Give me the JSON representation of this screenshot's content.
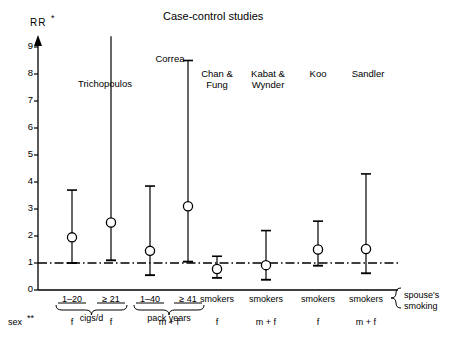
{
  "chart_data": {
    "type": "scatter",
    "title": "Case-control studies",
    "ylabel": "RR",
    "ylabel_superscript": "*",
    "xlabel": "",
    "ylim": [
      0,
      9.4
    ],
    "yticks": [
      0,
      1,
      2,
      3,
      4,
      5,
      6,
      7,
      8,
      9
    ],
    "ytick_labels": [
      "0",
      "1",
      "2",
      "3",
      "4",
      "5",
      "6",
      "7",
      "8",
      "9"
    ],
    "grid": false,
    "legend": null,
    "reference_line": {
      "value": 1,
      "style": "dash-dot"
    },
    "axis_color": "#000000",
    "marker": "open-circle",
    "series": [
      {
        "name": "Relative risk with 95% confidence interval",
        "points": [
          {
            "study": "Trichopoulos",
            "exposure": "1–20",
            "group": "cigs/d",
            "sex": "f",
            "value": 1.95,
            "low": 1.0,
            "high": 3.7,
            "clipped_high": false
          },
          {
            "study": "Trichopoulos",
            "exposure": "≥ 21",
            "group": "cigs/d",
            "sex": "f",
            "value": 2.5,
            "low": 1.1,
            "high": 9.4,
            "clipped_high": true
          },
          {
            "study": "Correa",
            "exposure": "1–40",
            "group": "pack years",
            "sex": "m + f",
            "value": 1.45,
            "low": 0.55,
            "high": 3.85,
            "clipped_high": false
          },
          {
            "study": "Correa",
            "exposure": "≥ 41",
            "group": "pack years",
            "sex": "m + f",
            "value": 3.1,
            "low": 1.05,
            "high": 8.5,
            "clipped_high": false
          },
          {
            "study": "Chan & Fung",
            "exposure": "smokers",
            "group": "",
            "sex": "f",
            "value": 0.78,
            "low": 0.45,
            "high": 1.25,
            "clipped_high": false
          },
          {
            "study": "Kabat & Wynder",
            "exposure": "smokers",
            "group": "",
            "sex": "m + f",
            "value": 0.92,
            "low": 0.38,
            "high": 2.2,
            "clipped_high": false
          },
          {
            "study": "Koo",
            "exposure": "smokers",
            "group": "",
            "sex": "f",
            "value": 1.5,
            "low": 0.9,
            "high": 2.55,
            "clipped_high": false
          },
          {
            "study": "Sandler",
            "exposure": "smokers",
            "group": "",
            "sex": "m + f",
            "value": 1.52,
            "low": 0.62,
            "high": 4.3,
            "clipped_high": false
          }
        ]
      }
    ],
    "study_headers": [
      {
        "label": "Trichopoulos",
        "lines": [
          "Trichopoulos"
        ],
        "x": 105,
        "y": 78
      },
      {
        "label": "Correa",
        "lines": [
          "Correa"
        ],
        "x": 170,
        "y": 53
      },
      {
        "label": "Chan & Fung",
        "lines": [
          "Chan &",
          "Fung"
        ],
        "x": 217,
        "y": 68
      },
      {
        "label": "Kabat & Wynder",
        "lines": [
          "Kabat &",
          "Wynder"
        ],
        "x": 268,
        "y": 68
      },
      {
        "label": "Koo",
        "lines": [
          "Koo"
        ],
        "x": 318,
        "y": 68
      },
      {
        "label": "Sandler",
        "lines": [
          "Sandler"
        ],
        "x": 368,
        "y": 68
      }
    ],
    "category_axis": {
      "exposure_labels": [
        "1–20",
        "≥ 21",
        "1–40",
        "≥ 41",
        "smokers",
        "smokers",
        "smokers",
        "smokers"
      ],
      "braces": [
        {
          "label": "cigs/d",
          "from": 0,
          "to": 1
        },
        {
          "label": "pack years",
          "from": 2,
          "to": 3
        }
      ],
      "right_annotation_lines": [
        "spouse's",
        "smoking"
      ],
      "sex_row_header": "sex",
      "sex_row_header_superscript": "**",
      "sex_values": [
        "f",
        "f",
        "m + f",
        "f",
        "m + f",
        "f",
        "m + f"
      ]
    }
  }
}
